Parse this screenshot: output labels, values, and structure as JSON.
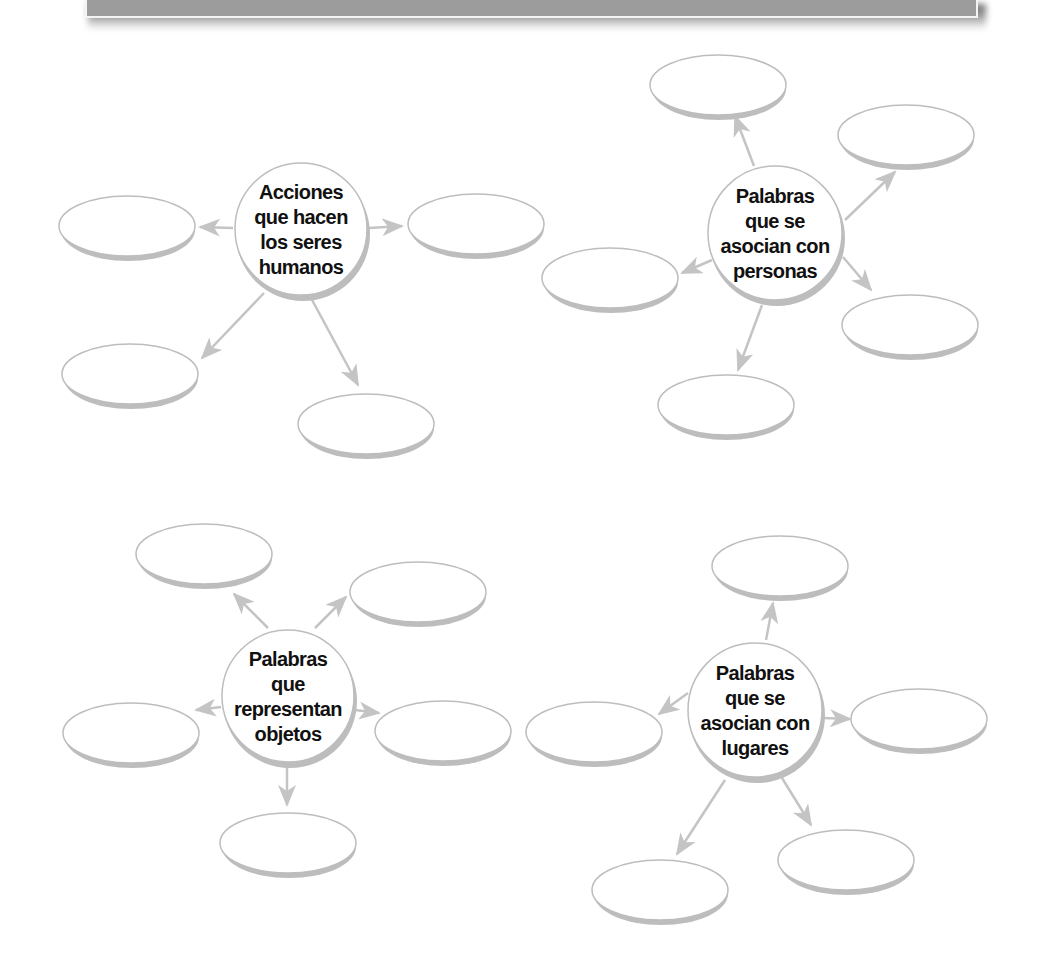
{
  "banner": {
    "fill_color": "#9c9c9c",
    "border_color": "#f4f4f4"
  },
  "style": {
    "stroke_color": "#c4c4c4",
    "outline_color": "#bdbdbd",
    "disc_shadow_color": "#bdbdbd",
    "text_color": "#111111",
    "bubble_fill": "#ffffff"
  },
  "diagrams": [
    {
      "id": "acciones",
      "center": {
        "cx": 301,
        "cy": 229,
        "r": 67
      },
      "label_lines": [
        "Acciones",
        "que hacen",
        "los seres",
        "humanos"
      ],
      "answer_bubbles": [
        {
          "cx": 127,
          "cy": 226,
          "rx": 68,
          "ry": 31,
          "value": ""
        },
        {
          "cx": 476,
          "cy": 224,
          "rx": 68,
          "ry": 31,
          "value": ""
        },
        {
          "cx": 130,
          "cy": 374,
          "rx": 68,
          "ry": 31,
          "value": ""
        },
        {
          "cx": 366,
          "cy": 424,
          "rx": 68,
          "ry": 31,
          "value": ""
        }
      ],
      "arrows": [
        {
          "x1": 233,
          "y1": 228,
          "x2": 200,
          "y2": 227
        },
        {
          "x1": 369,
          "y1": 228,
          "x2": 402,
          "y2": 226
        },
        {
          "x1": 264,
          "y1": 293,
          "x2": 202,
          "y2": 358
        },
        {
          "x1": 311,
          "y1": 298,
          "x2": 358,
          "y2": 385
        }
      ]
    },
    {
      "id": "personas",
      "center": {
        "cx": 775,
        "cy": 233,
        "r": 68
      },
      "label_lines": [
        "Palabras",
        "que se",
        "asocian con",
        "personas"
      ],
      "answer_bubbles": [
        {
          "cx": 718,
          "cy": 85,
          "rx": 68,
          "ry": 31,
          "value": ""
        },
        {
          "cx": 906,
          "cy": 135,
          "rx": 68,
          "ry": 31,
          "value": ""
        },
        {
          "cx": 610,
          "cy": 278,
          "rx": 68,
          "ry": 31,
          "value": ""
        },
        {
          "cx": 910,
          "cy": 325,
          "rx": 68,
          "ry": 31,
          "value": ""
        },
        {
          "cx": 726,
          "cy": 405,
          "rx": 68,
          "ry": 31,
          "value": ""
        }
      ],
      "arrows": [
        {
          "x1": 754,
          "y1": 166,
          "x2": 735,
          "y2": 116
        },
        {
          "x1": 845,
          "y1": 220,
          "x2": 895,
          "y2": 172
        },
        {
          "x1": 712,
          "y1": 260,
          "x2": 682,
          "y2": 273
        },
        {
          "x1": 843,
          "y1": 257,
          "x2": 871,
          "y2": 290
        },
        {
          "x1": 762,
          "y1": 305,
          "x2": 738,
          "y2": 370
        }
      ]
    },
    {
      "id": "objetos",
      "center": {
        "cx": 288,
        "cy": 696,
        "r": 67
      },
      "label_lines": [
        "Palabras",
        "que",
        "representan",
        "objetos"
      ],
      "answer_bubbles": [
        {
          "cx": 204,
          "cy": 554,
          "rx": 68,
          "ry": 31,
          "value": ""
        },
        {
          "cx": 418,
          "cy": 592,
          "rx": 68,
          "ry": 31,
          "value": ""
        },
        {
          "cx": 131,
          "cy": 733,
          "rx": 68,
          "ry": 31,
          "value": ""
        },
        {
          "cx": 443,
          "cy": 731,
          "rx": 68,
          "ry": 31,
          "value": ""
        },
        {
          "cx": 288,
          "cy": 843,
          "rx": 68,
          "ry": 31,
          "value": ""
        }
      ],
      "arrows": [
        {
          "x1": 268,
          "y1": 628,
          "x2": 234,
          "y2": 594
        },
        {
          "x1": 315,
          "y1": 628,
          "x2": 346,
          "y2": 597
        },
        {
          "x1": 221,
          "y1": 707,
          "x2": 196,
          "y2": 710
        },
        {
          "x1": 355,
          "y1": 710,
          "x2": 379,
          "y2": 713
        },
        {
          "x1": 287,
          "y1": 765,
          "x2": 287,
          "y2": 805
        }
      ]
    },
    {
      "id": "lugares",
      "center": {
        "cx": 755,
        "cy": 710,
        "r": 68
      },
      "label_lines": [
        "Palabras",
        "que se",
        "asocian con",
        "lugares"
      ],
      "answer_bubbles": [
        {
          "cx": 780,
          "cy": 566,
          "rx": 68,
          "ry": 31,
          "value": ""
        },
        {
          "cx": 594,
          "cy": 732,
          "rx": 68,
          "ry": 31,
          "value": ""
        },
        {
          "cx": 919,
          "cy": 719,
          "rx": 68,
          "ry": 31,
          "value": ""
        },
        {
          "cx": 846,
          "cy": 860,
          "rx": 68,
          "ry": 31,
          "value": ""
        },
        {
          "cx": 660,
          "cy": 890,
          "rx": 68,
          "ry": 31,
          "value": ""
        }
      ],
      "arrows": [
        {
          "x1": 766,
          "y1": 640,
          "x2": 773,
          "y2": 603
        },
        {
          "x1": 688,
          "y1": 693,
          "x2": 659,
          "y2": 714
        },
        {
          "x1": 823,
          "y1": 718,
          "x2": 850,
          "y2": 719
        },
        {
          "x1": 782,
          "y1": 778,
          "x2": 811,
          "y2": 825
        },
        {
          "x1": 725,
          "y1": 780,
          "x2": 677,
          "y2": 854
        }
      ]
    }
  ]
}
